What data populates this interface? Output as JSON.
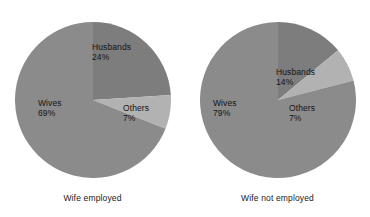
{
  "chart_data": [
    {
      "type": "pie",
      "title": "Wife employed",
      "categories": [
        "Husbands",
        "Wives",
        "Others"
      ],
      "values": [
        24,
        69,
        7
      ],
      "value_unit": "%",
      "labels": [
        "24%",
        "69%",
        "7%"
      ],
      "colors": [
        "#7d7d7d",
        "#8b8b8b",
        "#b2b2b2"
      ],
      "start_angle_deg": 0,
      "direction": "clockwise",
      "legend": "none",
      "grid": false
    },
    {
      "type": "pie",
      "title": "Wife not employed",
      "categories": [
        "Husbands",
        "Wives",
        "Others"
      ],
      "values": [
        14,
        79,
        7
      ],
      "value_unit": "%",
      "labels": [
        "14%",
        "79%",
        "7%"
      ],
      "colors": [
        "#7d7d7d",
        "#8b8b8b",
        "#b2b2b2"
      ],
      "start_angle_deg": 0,
      "direction": "clockwise",
      "legend": "none",
      "grid": false
    }
  ],
  "panels": {
    "left": {
      "caption": "Wife employed",
      "slices": {
        "husbands": {
          "name": "Husbands",
          "pct": "24%"
        },
        "wives": {
          "name": "Wives",
          "pct": "69%"
        },
        "others": {
          "name": "Others",
          "pct": "7%"
        }
      }
    },
    "right": {
      "caption": "Wife not employed",
      "slices": {
        "husbands": {
          "name": "Husbands",
          "pct": "14%"
        },
        "wives": {
          "name": "Wives",
          "pct": "79%"
        },
        "others": {
          "name": "Others",
          "pct": "7%"
        }
      }
    }
  },
  "colors": {
    "husbands": "#7d7d7d",
    "wives": "#8b8b8b",
    "others": "#b2b2b2",
    "background": "#ffffff",
    "text": "#141414"
  }
}
